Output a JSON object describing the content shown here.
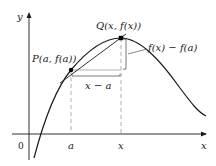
{
  "diagram": {
    "axes": {
      "x_label": "x",
      "y_label": "y",
      "origin_label": "0",
      "x_ticks": [
        "a",
        "x"
      ]
    },
    "points": [
      {
        "name": "P",
        "label": "P(a, f(a))"
      },
      {
        "name": "Q",
        "label": "Q(x, f(x))"
      }
    ],
    "annotations": {
      "horizontal_difference": "x − a",
      "vertical_difference": "f(x) − f(a)"
    },
    "colors": {
      "curve": "#1a1a1a",
      "axes": "#1a1a1a",
      "guide": "#9a9a9a",
      "bracket": "#555555",
      "point": "#000000"
    }
  }
}
